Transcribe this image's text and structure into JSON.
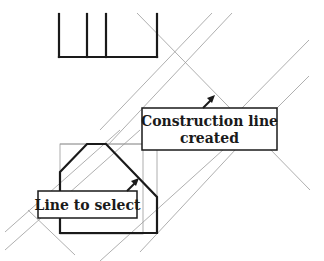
{
  "diagram": {
    "type": "cad-construction-line-illustration",
    "colors": {
      "background": "#ffffff",
      "geometry": "#1a1a1a",
      "construction_lines": "#9a9a9a",
      "label_border": "#1a1a1a",
      "label_fill": "#ffffff"
    },
    "callouts": [
      {
        "id": "construction-line-created",
        "lines": [
          "Construction line",
          "created"
        ],
        "arrow_target": "construction line"
      },
      {
        "id": "line-to-select",
        "lines": [
          "Line to select"
        ],
        "arrow_target": "polygon chamfer edge"
      }
    ]
  }
}
